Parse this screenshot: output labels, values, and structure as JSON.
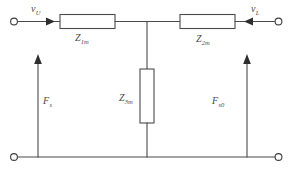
{
  "figure": {
    "background_color": "#ffffff",
    "line_color": "#4a4a4a",
    "width": 293,
    "height": 173
  },
  "labels": {
    "v_in": {
      "symbol": "v",
      "subscript": "U"
    },
    "v_out": {
      "symbol": "v",
      "subscript": "L"
    },
    "z_series_left": {
      "symbol": "Z",
      "subscript": "1m"
    },
    "z_series_right": {
      "symbol": "Z",
      "subscript": "2m"
    },
    "z_shunt": {
      "symbol": "Z",
      "subscript": "3m"
    },
    "force_left": {
      "symbol": "F",
      "subscript": "s"
    },
    "force_right": {
      "symbol": "F",
      "subscript": "s0"
    }
  },
  "components": {
    "series_impedance_left": "Z1m",
    "series_impedance_right": "Z2m",
    "shunt_impedance": "Z3m",
    "terminal_top_left": "input-terminal",
    "terminal_top_right": "output-terminal",
    "terminal_bottom_left": "input-return-terminal",
    "terminal_bottom_right": "output-return-terminal"
  },
  "arrows": {
    "input_current_direction": "right",
    "output_current_direction": "left",
    "left_force_direction": "up",
    "right_force_direction": "up"
  }
}
